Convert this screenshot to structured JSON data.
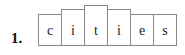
{
  "exercise": {
    "item_number": "1.",
    "word": "cities",
    "letters": [
      {
        "char": "c",
        "box_height": "short",
        "height_px": 32
      },
      {
        "char": "i",
        "box_height": "medium",
        "height_px": 37
      },
      {
        "char": "t",
        "box_height": "tall",
        "height_px": 41
      },
      {
        "char": "i",
        "box_height": "medium",
        "height_px": 37
      },
      {
        "char": "e",
        "box_height": "short",
        "height_px": 32
      },
      {
        "char": "s",
        "box_height": "short",
        "height_px": 32
      }
    ],
    "colors": {
      "box_border": "#8a8a8a",
      "letter_text": "#1a1a1a",
      "number_text": "#111111",
      "background": "#ffffff"
    }
  }
}
